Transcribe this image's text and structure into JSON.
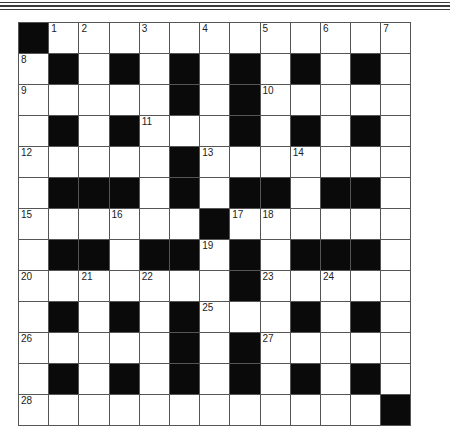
{
  "puzzle": {
    "type": "crossword",
    "rows": 13,
    "cols": 13,
    "layout": [
      "#............",
      ".#.#.#.#.#.#.",
      ".....#.#.....",
      ".#.#...#.#.#.",
      ".....#.......",
      ".###.#.##.##.",
      "......#......",
      ".##.##.#.###.",
      ".......#.....",
      ".#.#.#...#.#.",
      ".....#.#.....",
      ".#.#.#.#.#.#.",
      "............#"
    ],
    "numbers": [
      {
        "row": 0,
        "col": 1,
        "n": "1"
      },
      {
        "row": 0,
        "col": 2,
        "n": "2"
      },
      {
        "row": 0,
        "col": 4,
        "n": "3"
      },
      {
        "row": 0,
        "col": 6,
        "n": "4"
      },
      {
        "row": 0,
        "col": 8,
        "n": "5"
      },
      {
        "row": 0,
        "col": 10,
        "n": "6"
      },
      {
        "row": 0,
        "col": 12,
        "n": "7"
      },
      {
        "row": 1,
        "col": 0,
        "n": "8"
      },
      {
        "row": 2,
        "col": 0,
        "n": "9"
      },
      {
        "row": 2,
        "col": 8,
        "n": "10"
      },
      {
        "row": 3,
        "col": 4,
        "n": "11"
      },
      {
        "row": 4,
        "col": 0,
        "n": "12"
      },
      {
        "row": 4,
        "col": 6,
        "n": "13"
      },
      {
        "row": 4,
        "col": 9,
        "n": "14"
      },
      {
        "row": 6,
        "col": 0,
        "n": "15"
      },
      {
        "row": 6,
        "col": 3,
        "n": "16"
      },
      {
        "row": 6,
        "col": 7,
        "n": "17"
      },
      {
        "row": 6,
        "col": 8,
        "n": "18"
      },
      {
        "row": 7,
        "col": 6,
        "n": "19"
      },
      {
        "row": 8,
        "col": 0,
        "n": "20"
      },
      {
        "row": 8,
        "col": 2,
        "n": "21"
      },
      {
        "row": 8,
        "col": 4,
        "n": "22"
      },
      {
        "row": 8,
        "col": 8,
        "n": "23"
      },
      {
        "row": 8,
        "col": 10,
        "n": "24"
      },
      {
        "row": 9,
        "col": 6,
        "n": "25"
      },
      {
        "row": 10,
        "col": 0,
        "n": "26"
      },
      {
        "row": 10,
        "col": 8,
        "n": "27"
      },
      {
        "row": 12,
        "col": 0,
        "n": "28"
      }
    ]
  },
  "colors": {
    "block": "#0a0a0a",
    "cell": "#ffffff",
    "line": "#555555"
  }
}
